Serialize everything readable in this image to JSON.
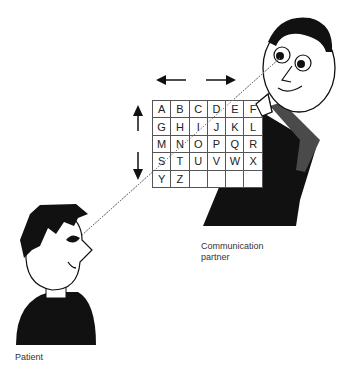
{
  "figure": {
    "type": "eye-gaze letter board communication diagram",
    "letter_board": {
      "rows": [
        [
          "A",
          "B",
          "C",
          "D",
          "E",
          "F"
        ],
        [
          "G",
          "H",
          "I",
          "J",
          "K",
          "L"
        ],
        [
          "M",
          "N",
          "O",
          "P",
          "Q",
          "R"
        ],
        [
          "S",
          "T",
          "U",
          "V",
          "W",
          "X"
        ],
        [
          "Y",
          "Z",
          "",
          "",
          "",
          ""
        ]
      ]
    },
    "arrows": {
      "horizontal": [
        "left-arrow",
        "right-arrow"
      ],
      "vertical": [
        "up-arrow",
        "down-arrow"
      ]
    },
    "labels": {
      "patient": "Patient",
      "partner_line1": "Communication",
      "partner_line2": "partner"
    },
    "colors": {
      "ink": "#111111",
      "sleeve": "#4a4a4a",
      "grid_line": "#555555",
      "gaze_line": "#777777"
    }
  }
}
